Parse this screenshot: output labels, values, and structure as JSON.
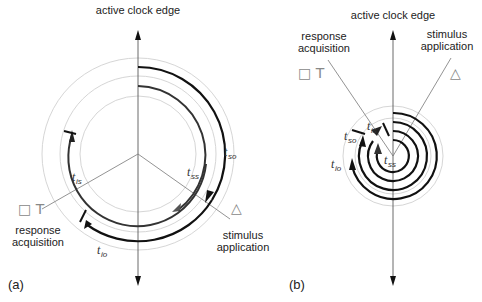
{
  "panels": [
    {
      "id": "a",
      "label": "(a)",
      "axis_label": "active clock edge",
      "response_label_line1": "response",
      "response_label_line2": "acquisition",
      "stimulus_label_line1": "stimulus",
      "stimulus_label_line2": "application",
      "response_symbols": "□ T",
      "stimulus_symbol": "△",
      "times": {
        "tso": {
          "t": "t",
          "sub": "so"
        },
        "tss": {
          "t": "t",
          "sub": "ss"
        },
        "tis": {
          "t": "t",
          "sub": "is"
        },
        "tio": {
          "t": "t",
          "sub": "io"
        }
      }
    },
    {
      "id": "b",
      "label": "(b)",
      "axis_label": "active clock edge",
      "response_label_line1": "response",
      "response_label_line2": "acquisition",
      "stimulus_label_line1": "stimulus",
      "stimulus_label_line2": "application",
      "response_symbols": "□ T",
      "stimulus_symbol": "△",
      "times": {
        "tso": {
          "t": "t",
          "sub": "so"
        },
        "tss": {
          "t": "t",
          "sub": "ss"
        },
        "tis": {
          "t": "t",
          "sub": "is"
        },
        "tio": {
          "t": "t",
          "sub": "io"
        }
      }
    }
  ],
  "colors": {
    "ring_gray": "#d4d4d4",
    "arc_black": "#111111",
    "arc_dark": "#333333",
    "arrow_gray": "#555555",
    "line_gray": "#777777"
  }
}
